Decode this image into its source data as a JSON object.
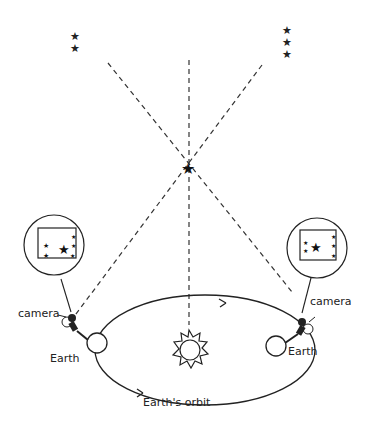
{
  "diagram": {
    "labels": {
      "camera_left": "camera",
      "camera_right": "camera",
      "earth_left": "Earth",
      "earth_right": "Earth",
      "orbit": "Earth's orbit"
    },
    "elements": {
      "distant_stars_left": 2,
      "distant_stars_right": 3,
      "nearby_star": "star",
      "sun": "sun",
      "photo_views": [
        "left view",
        "right view"
      ]
    },
    "colors": {
      "ink": "#222222",
      "background": "#ffffff"
    }
  }
}
